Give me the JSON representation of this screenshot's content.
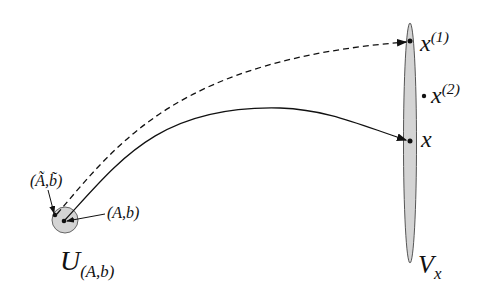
{
  "labels": {
    "x1_base": "x",
    "x1_sup": "(1)",
    "x2_base": "x",
    "x2_sup": "(2)",
    "x": "x",
    "Vx_base": "V",
    "Vx_sub": "x",
    "U_base": "U",
    "U_sub": "(A,b)",
    "Ab": "(A,b)",
    "Ab_tilde": "(Ã,b̃)"
  },
  "colors": {
    "region_fill": "#d4d4d4",
    "stroke": "#111111"
  }
}
